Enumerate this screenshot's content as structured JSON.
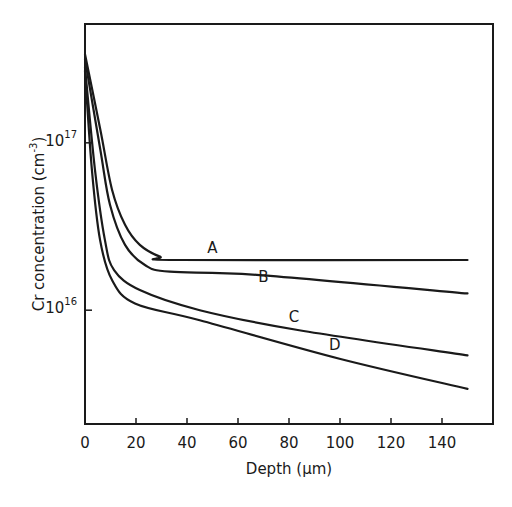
{
  "chart_data": {
    "type": "line",
    "title": "",
    "xlabel": "Depth (µm)",
    "ylabel": "Cr concentration (cm⁻³)",
    "ylabel_parts": {
      "base": "Cr concentration (cm",
      "sup": "-3",
      "close": ")"
    },
    "xlim": [
      0,
      160
    ],
    "ylim_log10": [
      15.32,
      17.71
    ],
    "yscale": "log",
    "grid": false,
    "legend": "inline curve labels",
    "x_ticks": [
      0,
      20,
      40,
      60,
      80,
      100,
      120,
      140
    ],
    "y_ticks": [
      {
        "value": 1e+17,
        "base": "10",
        "exp": "17"
      },
      {
        "value": 1e+16,
        "base": "10",
        "exp": "16"
      }
    ],
    "series": [
      {
        "name": "A",
        "x": [
          0,
          6,
          10.6,
          15.7,
          21.5,
          29.4,
          37.2,
          150
        ],
        "log10_y": [
          17.53,
          17.08,
          16.72,
          16.51,
          16.39,
          16.32,
          16.3,
          16.3
        ]
      },
      {
        "name": "B",
        "x": [
          0,
          6,
          9.8,
          15.7,
          23.5,
          33.3,
          68.5,
          150
        ],
        "log10_y": [
          17.5,
          16.96,
          16.63,
          16.39,
          16.27,
          16.23,
          16.21,
          16.1
        ]
      },
      {
        "name": "C",
        "x": [
          0,
          3.9,
          7.8,
          11.4,
          21.5,
          45,
          84,
          150
        ],
        "log10_y": [
          17.45,
          16.84,
          16.42,
          16.24,
          16.12,
          16.0,
          15.88,
          15.73
        ]
      },
      {
        "name": "D",
        "x": [
          0,
          2.7,
          5.9,
          10.6,
          19.6,
          45,
          99.8,
          150
        ],
        "log10_y": [
          17.43,
          16.84,
          16.42,
          16.18,
          16.04,
          15.94,
          15.71,
          15.53
        ]
      }
    ],
    "annotations": [
      {
        "text": "A",
        "x": 50,
        "log10_y": 16.34
      },
      {
        "text": "B",
        "x": 70,
        "log10_y": 16.17
      },
      {
        "text": "C",
        "x": 82,
        "log10_y": 15.93
      },
      {
        "text": "D",
        "x": 98,
        "log10_y": 15.76
      }
    ]
  },
  "layout": {
    "plot_px": {
      "left": 85,
      "top": 24,
      "right": 493,
      "bottom": 424
    },
    "line_color": "#1a1a1a"
  }
}
